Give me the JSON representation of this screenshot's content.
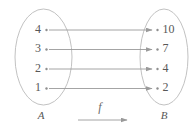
{
  "figure": {
    "domain_set": {
      "name": "A",
      "label": "A",
      "elements": [
        "4",
        "3",
        "2",
        "1"
      ]
    },
    "codomain_set": {
      "name": "B",
      "label": "B",
      "elements": [
        "10",
        "7",
        "4",
        "2"
      ]
    },
    "function": {
      "label": "f",
      "mappings": [
        {
          "from": "4",
          "to": "10"
        },
        {
          "from": "3",
          "to": "7"
        },
        {
          "from": "2",
          "to": "4"
        },
        {
          "from": "1",
          "to": "2"
        }
      ]
    },
    "colors": {
      "ellipse_stroke": "#c2c2c2",
      "arrow_stroke": "#9a9a9a",
      "text": "#585858",
      "dot": "#8f8f8f",
      "background": "#ffffff"
    }
  }
}
